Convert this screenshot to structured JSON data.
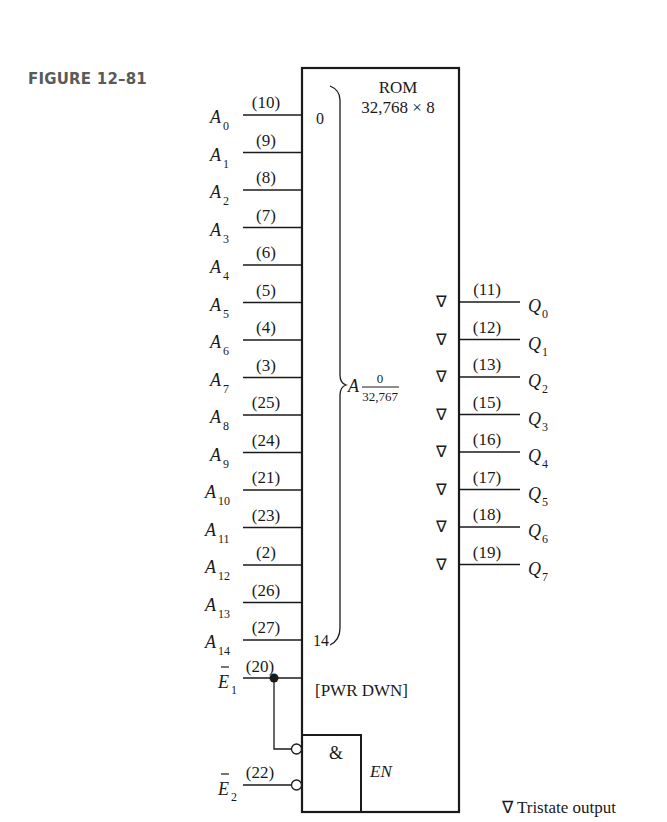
{
  "figure": {
    "label": "FIGURE 12–81",
    "chip_name": "ROM",
    "chip_size": "32,768 × 8",
    "address_group": {
      "prefix": "A",
      "range_top": "0",
      "range_bottom": "32,767",
      "first_index": "0",
      "last_index": "14"
    },
    "address_inputs": [
      {
        "name": "A",
        "sub": "0",
        "pin": "(10)"
      },
      {
        "name": "A",
        "sub": "1",
        "pin": "(9)"
      },
      {
        "name": "A",
        "sub": "2",
        "pin": "(8)"
      },
      {
        "name": "A",
        "sub": "3",
        "pin": "(7)"
      },
      {
        "name": "A",
        "sub": "4",
        "pin": "(6)"
      },
      {
        "name": "A",
        "sub": "5",
        "pin": "(5)"
      },
      {
        "name": "A",
        "sub": "6",
        "pin": "(4)"
      },
      {
        "name": "A",
        "sub": "7",
        "pin": "(3)"
      },
      {
        "name": "A",
        "sub": "8",
        "pin": "(25)"
      },
      {
        "name": "A",
        "sub": "9",
        "pin": "(24)"
      },
      {
        "name": "A",
        "sub": "10",
        "pin": "(21)"
      },
      {
        "name": "A",
        "sub": "11",
        "pin": "(23)"
      },
      {
        "name": "A",
        "sub": "12",
        "pin": "(2)"
      },
      {
        "name": "A",
        "sub": "13",
        "pin": "(26)"
      },
      {
        "name": "A",
        "sub": "14",
        "pin": "(27)"
      }
    ],
    "data_outputs": [
      {
        "name": "Q",
        "sub": "0",
        "pin": "(11)"
      },
      {
        "name": "Q",
        "sub": "1",
        "pin": "(12)"
      },
      {
        "name": "Q",
        "sub": "2",
        "pin": "(13)"
      },
      {
        "name": "Q",
        "sub": "3",
        "pin": "(15)"
      },
      {
        "name": "Q",
        "sub": "4",
        "pin": "(16)"
      },
      {
        "name": "Q",
        "sub": "5",
        "pin": "(17)"
      },
      {
        "name": "Q",
        "sub": "6",
        "pin": "(18)"
      },
      {
        "name": "Q",
        "sub": "7",
        "pin": "(19)"
      }
    ],
    "tristate_symbol": "∇",
    "enables": [
      {
        "name": "E",
        "sub": "1",
        "pin": "(20)",
        "bar": "‾"
      },
      {
        "name": "E",
        "sub": "2",
        "pin": "(22)",
        "bar": "‾"
      }
    ],
    "pwr_down_label": "[PWR DWN]",
    "and_gate_label": "&",
    "enable_label": "EN",
    "legend": "∇ Tristate output"
  }
}
